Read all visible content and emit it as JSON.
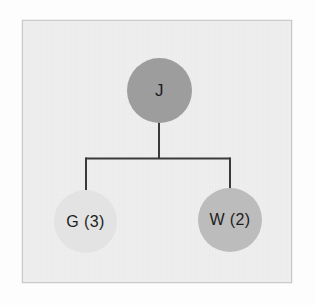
{
  "diagram": {
    "type": "tree",
    "title": "",
    "panel": {
      "background_color": "#eeefee",
      "border_color": "#c9cac9"
    },
    "edge_color": "#3a3a3a",
    "nodes": [
      {
        "id": "j",
        "label": "J",
        "role": "root",
        "fill_color": "#9d9d9d",
        "text_color": "#1d1d1d"
      },
      {
        "id": "g",
        "label": "G (3)",
        "role": "child",
        "fill_color": "#e2e3e2",
        "text_color": "#1d1d1d"
      },
      {
        "id": "w",
        "label": "W (2)",
        "role": "child",
        "fill_color": "#bcbcbc",
        "text_color": "#1d1d1d"
      }
    ],
    "edges": [
      {
        "from": "j",
        "to": "g"
      },
      {
        "from": "j",
        "to": "w"
      }
    ]
  }
}
